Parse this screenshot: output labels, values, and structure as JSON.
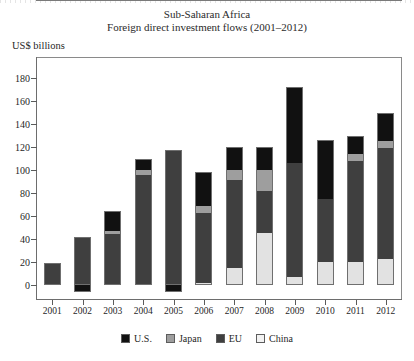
{
  "header": {
    "title_line1": "Sub-Saharan Africa",
    "title_line2": "Foreign direct investment flows (2001–2012)",
    "unit_label": "US$ billions"
  },
  "legend": {
    "position": "bottom-center",
    "items": [
      {
        "key": "us",
        "label": "U.S.",
        "color": "#111111"
      },
      {
        "key": "japan",
        "label": "Japan",
        "color": "#9e9e9e"
      },
      {
        "key": "eu",
        "label": "EU",
        "color": "#3f3f3f"
      },
      {
        "key": "china",
        "label": "China",
        "color": "#f2f2f2"
      }
    ]
  },
  "axes": {
    "y_ticks": [
      180,
      160,
      140,
      120,
      100,
      80,
      60,
      40,
      20,
      0
    ],
    "y_min": -20,
    "y_max": 190,
    "x_ticks": [
      "2001",
      "2002",
      "2003",
      "2004",
      "2005",
      "2006",
      "2007",
      "2008",
      "2009",
      "2010",
      "2011",
      "2012"
    ]
  },
  "chart_data": {
    "type": "bar",
    "subtype": "stacked-bar",
    "xlabel": "",
    "ylabel": "US$ billions",
    "ylim": [
      -20,
      190
    ],
    "grid": false,
    "legend_position": "bottom-center",
    "categories": [
      "2001",
      "2002",
      "2003",
      "2004",
      "2005",
      "2006",
      "2007",
      "2008",
      "2009",
      "2010",
      "2011",
      "2012"
    ],
    "series": [
      {
        "name": "China",
        "color": "#e2e2e2",
        "values": [
          0,
          0,
          0,
          0,
          0,
          2,
          15,
          45,
          7,
          20,
          20,
          23
        ]
      },
      {
        "name": "EU",
        "color": "#3f3f3f",
        "values": [
          19,
          42,
          44,
          96,
          117,
          61,
          76,
          37,
          99,
          55,
          88,
          96
        ]
      },
      {
        "name": "Japan",
        "color": "#9e9e9e",
        "values": [
          0,
          0,
          3,
          4,
          0,
          6,
          9,
          18,
          0,
          0,
          6,
          6
        ]
      },
      {
        "name": "U.S.",
        "color": "#111111",
        "values": [
          0,
          -6,
          17,
          10,
          -6,
          29,
          20,
          20,
          66,
          51,
          16,
          25
        ]
      }
    ],
    "totals": [
      19,
      42,
      64,
      110,
      117,
      98,
      120,
      120,
      172,
      126,
      130,
      150
    ]
  }
}
